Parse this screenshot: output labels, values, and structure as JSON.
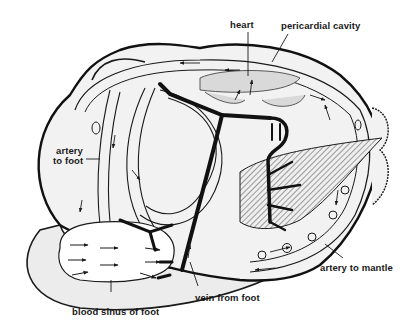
{
  "diagram": {
    "type": "anatomical-diagram",
    "colors": {
      "background": "#ffffff",
      "outline": "#1a1a1a",
      "fill_light": "#ececec",
      "fill_mid": "#d9d9d9",
      "vein": "#111111"
    },
    "labels": {
      "heart": "heart",
      "pericardial_cavity": "pericardial cavity",
      "artery_to_foot_line1": "artery",
      "artery_to_foot_line2": "to foot",
      "artery_to_mantle": "artery to mantle",
      "vein_from_foot": "vein from foot",
      "blood_sinus_of_foot": "blood sinus of foot"
    }
  }
}
